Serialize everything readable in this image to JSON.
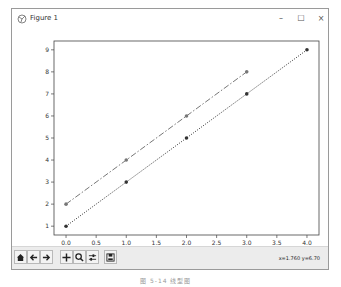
{
  "window": {
    "title": "Figure 1",
    "controls": {
      "minimize": "–",
      "maximize": "☐",
      "close": "×"
    }
  },
  "toolbar": {
    "buttons": [
      {
        "name": "home",
        "icon": "home-icon"
      },
      {
        "name": "back",
        "icon": "arrow-left-icon"
      },
      {
        "name": "forward",
        "icon": "arrow-right-icon"
      },
      {
        "name": "pan",
        "icon": "move-icon"
      },
      {
        "name": "zoom",
        "icon": "magnifier-icon"
      },
      {
        "name": "configure-subplots",
        "icon": "sliders-icon"
      },
      {
        "name": "save",
        "icon": "floppy-disk-icon"
      }
    ],
    "coordinates": "x=1.760 y=6.70"
  },
  "caption": "图 5-14  线型图",
  "chart_data": {
    "type": "line",
    "title": "",
    "xlabel": "",
    "ylabel": "",
    "xlim": [
      -0.2,
      4.2
    ],
    "ylim": [
      0.6,
      9.4
    ],
    "xticks": [
      "0.0",
      "0.5",
      "1.0",
      "1.5",
      "2.0",
      "2.5",
      "3.0",
      "3.5",
      "4.0"
    ],
    "yticks": [
      "1",
      "2",
      "3",
      "4",
      "5",
      "6",
      "7",
      "8",
      "9"
    ],
    "grid": false,
    "legend": null,
    "series": [
      {
        "name": "series-1",
        "style": "dotted",
        "marker": "o",
        "color": "#333333",
        "x": [
          0,
          1,
          2,
          3,
          4
        ],
        "y": [
          1,
          3,
          5,
          7,
          9
        ]
      },
      {
        "name": "series-2",
        "style": "dashdot",
        "marker": "o",
        "color": "#777777",
        "x": [
          0,
          1,
          2,
          3
        ],
        "y": [
          2,
          4,
          6,
          8
        ]
      }
    ]
  }
}
